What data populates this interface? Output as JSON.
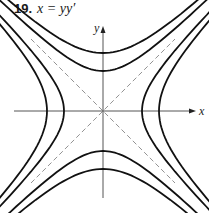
{
  "title": {
    "number": "19.",
    "equation": "x = yy′"
  },
  "diagram": {
    "origin": [
      103,
      111
    ],
    "axes": {
      "x_label": "x",
      "y_label": "y",
      "x_range": [
        14,
        192
      ],
      "y_range": [
        198,
        30
      ]
    },
    "asymptotes": [
      "y = x",
      "y = -x"
    ],
    "curves_description": "Hyperbola family x^2 - y^2 = C (solutions of x = y y')",
    "horizontal_vertices_px": [
      39,
      56
    ],
    "vertical_vertices_px": [
      40,
      58
    ],
    "colors": {
      "curve": "#111111",
      "axis": "#555555",
      "asymptote": "#777777"
    }
  }
}
